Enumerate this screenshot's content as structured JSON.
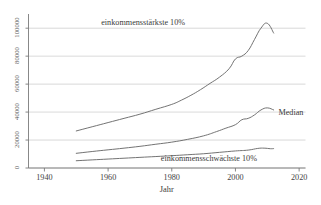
{
  "chart_data": {
    "type": "line",
    "title": "",
    "xlabel": "Jahr",
    "ylabel": "",
    "xlim": [
      1935,
      2022
    ],
    "ylim": [
      0,
      108000
    ],
    "grid": true,
    "legend_position": "inline-annotations",
    "xticks": [
      "1940",
      "1960",
      "1980",
      "2000",
      "2020"
    ],
    "xtick_values": [
      1940,
      1960,
      1980,
      2000,
      2020
    ],
    "yticks": [
      "0",
      "20000",
      "40000",
      "60000",
      "80000",
      "100000"
    ],
    "ytick_values": [
      0,
      20000,
      40000,
      60000,
      80000,
      100000
    ],
    "series": [
      {
        "name": "einkommensstärkste 10%",
        "x": [
          1950,
          1955,
          1960,
          1965,
          1970,
          1975,
          1980,
          1983,
          1986,
          1989,
          1992,
          1995,
          1998,
          2000,
          2002,
          2004,
          2006,
          2008,
          2010,
          2012
        ],
        "values": [
          26500,
          29500,
          32500,
          35500,
          38500,
          42000,
          45500,
          48500,
          52000,
          56000,
          60500,
          65000,
          71000,
          78000,
          80000,
          84000,
          92000,
          100000,
          103500,
          96500
        ]
      },
      {
        "name": "Median",
        "x": [
          1950,
          1955,
          1960,
          1965,
          1970,
          1975,
          1980,
          1985,
          1990,
          1994,
          1997,
          2000,
          2002,
          2004,
          2006,
          2008,
          2010,
          2012
        ],
        "values": [
          10500,
          11800,
          13000,
          14200,
          15500,
          17000,
          18500,
          20500,
          23000,
          26000,
          28500,
          31000,
          34500,
          35500,
          38000,
          41500,
          43000,
          41500
        ]
      },
      {
        "name": "einkommensschwächste 10%",
        "x": [
          1950,
          1955,
          1960,
          1965,
          1970,
          1975,
          1980,
          1985,
          1990,
          1995,
          2000,
          2004,
          2007,
          2009,
          2011,
          2012
        ],
        "values": [
          5200,
          5800,
          6400,
          7000,
          7600,
          8200,
          8800,
          9500,
          10200,
          11200,
          12200,
          12800,
          14000,
          14200,
          13800,
          13900
        ]
      }
    ],
    "annotations": [
      {
        "name": "einkommensstaerkste-label",
        "text": "einkommensstärkste 10%",
        "x": 1972,
        "y": 103500
      },
      {
        "name": "median-label",
        "text": "Median",
        "x": 2016,
        "y": 39500
      },
      {
        "name": "einkommensschwaechste-label",
        "text": "einkommensschwächste 10%",
        "x": 1992,
        "y": 6500
      }
    ],
    "colors": {
      "line": "#6b6b6b",
      "grid": "#c9c9c9",
      "axis": "#7a7a7a",
      "text": "#3f3f3f",
      "background": "#ffffff"
    }
  }
}
